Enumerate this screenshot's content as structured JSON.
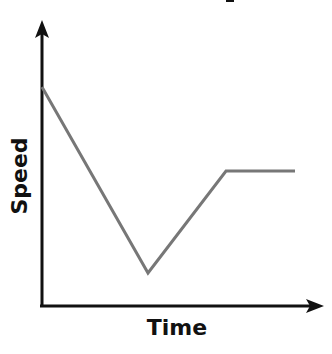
{
  "chart_data": {
    "type": "line",
    "title": "",
    "xlabel": "Time",
    "ylabel": "Speed",
    "grid": false,
    "legend": null,
    "axis_ticks": false,
    "line_color": "#777777",
    "axis_color": "#111111",
    "series": [
      {
        "name": "Speed",
        "points_px": [
          [
            42,
            87
          ],
          [
            148,
            273
          ],
          [
            226,
            171
          ],
          [
            295,
            171
          ]
        ],
        "description": "Speed starts high, decreases linearly to a minimum, increases linearly to a moderate level, then stays constant"
      }
    ],
    "x": [
      0,
      0.42,
      0.72,
      1.0
    ],
    "values": [
      0.8,
      0.13,
      0.49,
      0.49
    ]
  },
  "labels": {
    "x_axis": "Time",
    "y_axis": "Speed"
  }
}
